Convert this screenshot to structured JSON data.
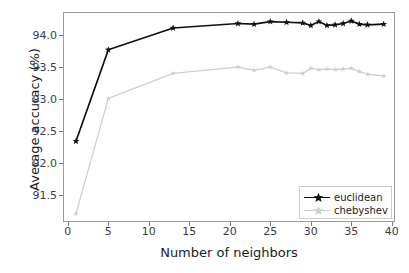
{
  "chart_data": {
    "type": "line",
    "title": "",
    "xlabel": "Number of neighbors",
    "ylabel": "Average accuracy (%)",
    "xlim": [
      -0.6,
      40.4
    ],
    "ylim": [
      91.08,
      94.36
    ],
    "xticks": [
      0,
      5,
      10,
      15,
      20,
      25,
      30,
      35,
      40
    ],
    "yticks": [
      91.5,
      92.0,
      92.5,
      93.0,
      93.5,
      94.0
    ],
    "xtick_labels": [
      "0",
      "5",
      "10",
      "15",
      "20",
      "25",
      "30",
      "35",
      "40"
    ],
    "ytick_labels": [
      "91.5",
      "92.0",
      "92.5",
      "93.0",
      "93.5",
      "94.0"
    ],
    "grid": false,
    "legend_position": "lower right",
    "x": [
      1,
      5,
      13,
      21,
      23,
      25,
      27,
      29,
      30,
      31,
      32,
      33,
      34,
      35,
      36,
      37,
      39
    ],
    "series": [
      {
        "name": "euclidean",
        "color": "#101010",
        "marker": "star",
        "values": [
          92.34,
          93.77,
          94.11,
          94.18,
          94.17,
          94.21,
          94.2,
          94.19,
          94.15,
          94.21,
          94.15,
          94.16,
          94.18,
          94.22,
          94.17,
          94.16,
          94.17
        ]
      },
      {
        "name": "chebyshev",
        "color": "#cfcfcf",
        "marker": "star",
        "values": [
          91.21,
          93.01,
          93.4,
          93.5,
          93.45,
          93.5,
          93.41,
          93.4,
          93.48,
          93.46,
          93.47,
          93.46,
          93.47,
          93.48,
          93.43,
          93.39,
          93.36
        ]
      }
    ]
  },
  "legend": {
    "items": [
      {
        "label": "euclidean"
      },
      {
        "label": "chebyshev"
      }
    ]
  }
}
